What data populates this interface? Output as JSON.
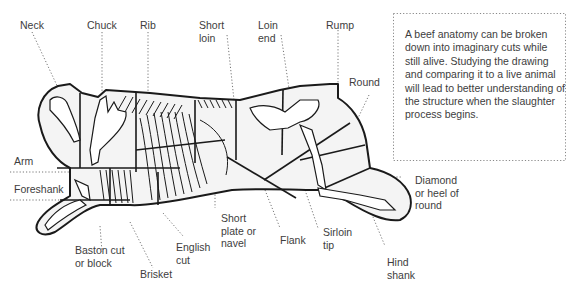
{
  "diagram": {
    "line_color": "#1a1a1a",
    "fill_color": "#f2f2f2",
    "leader_color": "#777777",
    "labels": {
      "neck": "Neck",
      "chuck": "Chuck",
      "rib": "Rib",
      "short_loin": "Short\nloin",
      "loin_end": "Loin\nend",
      "rump": "Rump",
      "round": "Round",
      "arm": "Arm",
      "foreshank": "Foreshank",
      "diamond": "Diamond\nor heel of\nround",
      "short_plate": "Short\nplate or\nnavel",
      "flank": "Flank",
      "sirloin_tip": "Sirloin\ntip",
      "baston_cut": "Baston cut\nor block",
      "english_cut": "English\ncut",
      "brisket": "Brisket",
      "hind_shank": "Hind\nshank"
    },
    "note": "A beef anatomy can be broken down into imaginary cuts while still alive. Studying the drawing and comparing it to a live animal will lead to better understanding of the structure when the slaughter process begins."
  }
}
